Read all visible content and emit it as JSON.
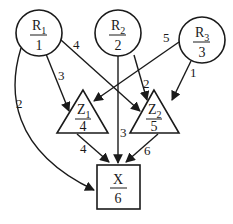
{
  "diagram": {
    "type": "directed-graph",
    "nodes": {
      "r1": {
        "name": "R",
        "subscript": "1",
        "value": "1",
        "shape": "circle"
      },
      "r2": {
        "name": "R",
        "subscript": "2",
        "value": "2",
        "shape": "circle"
      },
      "r3": {
        "name": "R",
        "subscript": "3",
        "value": "3",
        "shape": "circle"
      },
      "z1": {
        "name": "Z",
        "subscript": "1",
        "value": "4",
        "shape": "triangle"
      },
      "z2": {
        "name": "Z",
        "subscript": "2",
        "value": "5",
        "shape": "triangle"
      },
      "x": {
        "name": "X",
        "subscript": "",
        "value": "6",
        "shape": "square"
      }
    },
    "edges": {
      "r1_x": {
        "from": "R1",
        "to": "X",
        "label": "2"
      },
      "r1_z1": {
        "from": "R1",
        "to": "Z1",
        "label": "3"
      },
      "r1_z2": {
        "from": "R1",
        "to": "Z2",
        "label": "4"
      },
      "r2_z2": {
        "from": "R2",
        "to": "Z2",
        "label": "2"
      },
      "r2_x": {
        "from": "R2",
        "to": "X",
        "label": "3"
      },
      "r3_z1": {
        "from": "R3",
        "to": "Z1",
        "label": "5"
      },
      "r3_z2": {
        "from": "R3",
        "to": "Z2",
        "label": "1"
      },
      "z1_x": {
        "from": "Z1",
        "to": "X",
        "label": "4"
      },
      "z2_x": {
        "from": "Z2",
        "to": "X",
        "label": "6"
      }
    },
    "colors": {
      "stroke": "#1a1a1a",
      "background": "#ffffff"
    }
  }
}
